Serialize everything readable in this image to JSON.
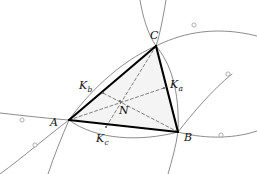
{
  "figure": {
    "kind": "geometry-diagram",
    "background_color": "#ffffff",
    "triangle_fill": "#f4f4f4",
    "triangle_stroke": "#000000",
    "curve_stroke": "#6b6b6b",
    "dashed_stroke": "#555555",
    "marker_stroke": "#9a9a9a",
    "marker_fill": "#ffffff"
  },
  "points": {
    "A": {
      "label": "A",
      "sub": "",
      "x": 69,
      "y": 120,
      "label_x": 50,
      "label_y": 126
    },
    "B": {
      "label": "B",
      "sub": "",
      "x": 178,
      "y": 132,
      "label_x": 184,
      "label_y": 141
    },
    "C": {
      "label": "C",
      "sub": "",
      "x": 156,
      "y": 46,
      "label_x": 150,
      "label_y": 39
    },
    "N": {
      "label": "N",
      "sub": "",
      "x": 120,
      "y": 101,
      "label_x": 119,
      "label_y": 114
    },
    "Ka": {
      "label": "K",
      "sub": "a",
      "x": 164,
      "y": 88,
      "label_x": 170,
      "label_y": 88
    },
    "Kb": {
      "label": "K",
      "sub": "b",
      "x": 103,
      "y": 93,
      "label_x": 79,
      "label_y": 89
    },
    "Kc": {
      "label": "K",
      "sub": "c",
      "x": 106,
      "y": 127,
      "label_x": 96,
      "label_y": 142
    }
  },
  "markers": [
    {
      "name": "curve-marker-upper-right",
      "x": 194,
      "y": 25
    },
    {
      "name": "curve-marker-right-isolated",
      "x": 228,
      "y": 74
    },
    {
      "name": "curve-marker-lower-right",
      "x": 221,
      "y": 135
    },
    {
      "name": "curve-marker-left",
      "x": 22,
      "y": 120
    },
    {
      "name": "curve-marker-lower-left",
      "x": 35,
      "y": 145
    }
  ],
  "segments": {
    "sides": [
      {
        "name": "side-AB",
        "from": "A",
        "to": "B"
      },
      {
        "name": "side-BC",
        "from": "B",
        "to": "C"
      },
      {
        "name": "side-CA",
        "from": "C",
        "to": "A"
      }
    ],
    "cevians": [
      {
        "name": "cevian-A-Ka",
        "from": "A",
        "to": "Ka"
      },
      {
        "name": "cevian-B-Kb",
        "from": "B",
        "to": "Kb"
      },
      {
        "name": "cevian-C-Kc",
        "from": "C",
        "to": "Kc"
      }
    ]
  },
  "curves": [
    {
      "name": "curve-through-C-upper-left",
      "d": "M 140 0 C 143 18 148 34 156 46"
    },
    {
      "name": "curve-through-C-upper-right",
      "d": "M 166 0 C 163 18 160 34 156 46"
    },
    {
      "name": "curve-C-to-B-inner",
      "d": "M 156 46 C 170 62 180 90 178 132"
    },
    {
      "name": "curve-C-to-upper-right-arc",
      "d": "M 156 46 C 176 36 210 24 257 36"
    },
    {
      "name": "curve-A-to-C-concave",
      "d": "M 69 120 C 86 96 118 62 156 46"
    },
    {
      "name": "curve-left-arm-upper",
      "d": "M 0 113 C 26 116 54 119 69 120"
    },
    {
      "name": "curve-left-arm-lower",
      "d": "M 0 174 C 22 158 50 134 69 120"
    },
    {
      "name": "curve-A-to-B-sag",
      "d": "M 69 120 C 96 140 140 142 178 132"
    },
    {
      "name": "curve-B-to-right-arc",
      "d": "M 178 132 C 200 138 230 140 257 131"
    },
    {
      "name": "curve-B-down",
      "d": "M 178 132 C 176 146 172 160 168 174"
    },
    {
      "name": "curve-B-up-right",
      "d": "M 178 132 C 192 114 212 90 232 74"
    },
    {
      "name": "curve-A-down-right",
      "d": "M 69 120 C 62 136 54 156 48 174"
    }
  ]
}
